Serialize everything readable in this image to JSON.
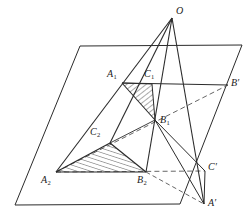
{
  "figure": {
    "stroke_color": "#2b2b2b",
    "dashed_color": "#555555",
    "hatch_color": "#2b2b2b",
    "background": "#ffffff"
  },
  "labels": {
    "O": {
      "text": "O",
      "sub": "",
      "x": 176,
      "y": 8
    },
    "A1": {
      "text": "A",
      "sub": "1",
      "x": 108,
      "y": 70
    },
    "C1": {
      "text": "C",
      "sub": "1",
      "x": 145,
      "y": 70
    },
    "B1": {
      "text": "B",
      "sub": "1",
      "x": 160,
      "y": 116
    },
    "C2": {
      "text": "C",
      "sub": "2",
      "x": 91,
      "y": 128
    },
    "A2": {
      "text": "A",
      "sub": "2",
      "x": 42,
      "y": 176
    },
    "B2": {
      "text": "B",
      "sub": "2",
      "x": 138,
      "y": 176
    },
    "Bp": {
      "text": "B",
      "sub": "",
      "prime": "′",
      "x": 231,
      "y": 79
    },
    "Cp": {
      "text": "C",
      "sub": "",
      "prime": "′",
      "x": 208,
      "y": 163
    },
    "Ap": {
      "text": "A",
      "sub": "",
      "prime": "′",
      "x": 208,
      "y": 199
    }
  },
  "points": {
    "O": {
      "x": 172,
      "y": 18
    },
    "A1": {
      "x": 122,
      "y": 83
    },
    "C1": {
      "x": 152,
      "y": 84
    },
    "B1": {
      "x": 155,
      "y": 120
    },
    "C2": {
      "x": 110,
      "y": 143
    },
    "A2": {
      "x": 56,
      "y": 172
    },
    "B2": {
      "x": 146,
      "y": 172
    },
    "Bp": {
      "x": 228,
      "y": 85
    },
    "Cp": {
      "x": 205,
      "y": 171
    },
    "Ap": {
      "x": 204,
      "y": 204
    }
  },
  "plane": {
    "name": "base-plane-parallelogram",
    "corners": [
      {
        "x": 80,
        "y": 46
      },
      {
        "x": 242,
        "y": 45
      },
      {
        "x": 180,
        "y": 204
      },
      {
        "x": 15,
        "y": 205
      }
    ]
  },
  "solid_edges": [
    {
      "name": "edge-O-A1-A2",
      "from": "O",
      "to": "A2",
      "style": "solid"
    },
    {
      "name": "edge-O-B1-B2",
      "from": "O",
      "to": "B2",
      "style": "solid"
    },
    {
      "name": "edge-O-C1-C2",
      "from": "O",
      "to": "C2",
      "style": "solid"
    },
    {
      "name": "edge-O-Ap",
      "from": "O",
      "to": "Ap",
      "style": "solid"
    },
    {
      "name": "edge-A1-C1",
      "from": "A1",
      "to": "C1",
      "style": "solid"
    },
    {
      "name": "edge-A1-B1",
      "from": "A1",
      "to": "B1",
      "style": "solid"
    },
    {
      "name": "edge-C1-B1",
      "from": "C1",
      "to": "B1",
      "style": "solid"
    },
    {
      "name": "edge-A2-C2",
      "from": "A2",
      "to": "C2",
      "style": "solid"
    },
    {
      "name": "edge-A2-B2",
      "from": "A2",
      "to": "B2",
      "style": "solid"
    },
    {
      "name": "edge-C2-B2",
      "from": "C2",
      "to": "B2",
      "style": "solid"
    },
    {
      "name": "edge-A1-Bp",
      "from": "A1",
      "to": "Bp",
      "style": "solid"
    },
    {
      "name": "edge-B1-Cp",
      "from": "B1",
      "to": "Cp",
      "style": "solid"
    },
    {
      "name": "edge-B1-Ap",
      "from": "B1",
      "to": "Ap",
      "style": "solid"
    },
    {
      "name": "edge-Cp-Ap",
      "from": "Cp",
      "to": "Ap",
      "style": "solid"
    },
    {
      "name": "edge-A2-Bp-dashed-axis",
      "from": "A2",
      "to": "Bp",
      "style": "dashed"
    },
    {
      "name": "edge-A2-Cp-dashed",
      "from": "A2",
      "to": "Cp",
      "style": "dashed"
    },
    {
      "name": "edge-B2-Ap-dashed",
      "from": "B2",
      "to": "Ap",
      "style": "dashed"
    }
  ],
  "hatched_regions": [
    {
      "name": "hatched-triangle-upper",
      "vertices": [
        "A1",
        "C1",
        "B1"
      ],
      "hatch_angle_deg": 50
    },
    {
      "name": "hatched-triangle-lower",
      "vertices": [
        "A2",
        "C2",
        "B2"
      ],
      "hatch_angle_deg": 18
    }
  ]
}
